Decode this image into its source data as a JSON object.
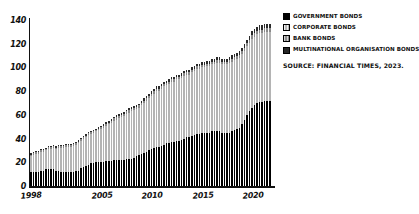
{
  "chart_data": {
    "type": "bar",
    "stacked": true,
    "title": "",
    "subtitle": "",
    "xlabel": "",
    "ylabel": "",
    "ylim": [
      0,
      140
    ],
    "yticks": [
      0,
      20,
      40,
      60,
      80,
      100,
      120,
      140
    ],
    "xticks": [
      "1998",
      "2005",
      "2010",
      "2015",
      "2020"
    ],
    "xtick_indices": [
      0,
      28,
      48,
      68,
      88
    ],
    "grid": false,
    "legend_position": "top-right",
    "x": [
      "1998",
      "1998",
      "1998",
      "1998",
      "1999",
      "1999",
      "1999",
      "1999",
      "2000",
      "2000",
      "2000",
      "2000",
      "2001",
      "2001",
      "2001",
      "2001",
      "2002",
      "2002",
      "2002",
      "2002",
      "2003",
      "2003",
      "2003",
      "2003",
      "2004",
      "2004",
      "2004",
      "2004",
      "2005",
      "2005",
      "2005",
      "2005",
      "2006",
      "2006",
      "2006",
      "2006",
      "2007",
      "2007",
      "2007",
      "2007",
      "2008",
      "2008",
      "2008",
      "2008",
      "2009",
      "2009",
      "2009",
      "2009",
      "2010",
      "2010",
      "2010",
      "2010",
      "2011",
      "2011",
      "2011",
      "2011",
      "2012",
      "2012",
      "2012",
      "2012",
      "2013",
      "2013",
      "2013",
      "2013",
      "2014",
      "2014",
      "2014",
      "2014",
      "2015",
      "2015",
      "2015",
      "2015",
      "2016",
      "2016",
      "2016",
      "2016",
      "2017",
      "2017",
      "2017",
      "2017",
      "2018",
      "2018",
      "2018",
      "2018",
      "2019",
      "2019",
      "2019",
      "2019",
      "2020",
      "2020",
      "2020",
      "2020",
      "2021",
      "2021",
      "2021",
      "2021"
    ],
    "series": [
      {
        "name": "Government bonds",
        "color": "#000000",
        "values": [
          12,
          12,
          12,
          12,
          13,
          13,
          14,
          14,
          14,
          14,
          13,
          13,
          12,
          12,
          12,
          12,
          12,
          12,
          13,
          13,
          15,
          16,
          17,
          18,
          19,
          19,
          20,
          20,
          20,
          20,
          21,
          21,
          21,
          22,
          22,
          22,
          22,
          22,
          23,
          23,
          23,
          24,
          25,
          26,
          27,
          28,
          29,
          30,
          31,
          32,
          33,
          33,
          34,
          35,
          36,
          36,
          37,
          37,
          38,
          38,
          39,
          40,
          41,
          41,
          42,
          43,
          44,
          44,
          45,
          45,
          45,
          45,
          46,
          46,
          46,
          46,
          45,
          45,
          45,
          45,
          46,
          47,
          48,
          49,
          52,
          56,
          60,
          63,
          66,
          68,
          70,
          71,
          71,
          72,
          72,
          72
        ]
      },
      {
        "name": "Corporate bonds",
        "color": "#b4b4b4",
        "values": [
          13,
          14,
          15,
          15,
          16,
          16,
          16,
          17,
          17,
          18,
          18,
          19,
          20,
          20,
          21,
          21,
          21,
          22,
          22,
          23,
          23,
          24,
          24,
          25,
          25,
          26,
          26,
          27,
          28,
          29,
          30,
          31,
          32,
          33,
          34,
          35,
          36,
          37,
          38,
          39,
          40,
          40,
          40,
          40,
          41,
          42,
          43,
          44,
          45,
          46,
          47,
          47,
          48,
          49,
          49,
          50,
          51,
          51,
          52,
          52,
          52,
          53,
          53,
          53,
          54,
          54,
          55,
          55,
          55,
          55,
          56,
          56,
          57,
          57,
          58,
          58,
          58,
          58,
          58,
          59,
          59,
          59,
          59,
          59,
          59,
          58,
          58,
          58,
          58,
          58,
          58,
          58,
          58,
          58,
          58,
          58
        ]
      },
      {
        "name": "Bank bonds",
        "color": "#8a8a8a",
        "values": [
          1.5,
          1.5,
          1.5,
          1.5,
          1.5,
          1.5,
          1.5,
          1.5,
          1.5,
          1.5,
          1.5,
          1.5,
          1.5,
          1.5,
          1.5,
          1.5,
          1.5,
          1.5,
          1.5,
          1.5,
          1.5,
          1.5,
          1.5,
          1.5,
          1.5,
          1.5,
          1.5,
          1.5,
          1.5,
          1.5,
          1.5,
          1.5,
          2,
          2,
          2,
          2,
          2,
          2,
          2,
          2,
          2,
          2,
          2,
          2,
          2,
          2,
          2,
          2,
          2,
          2,
          2,
          2,
          2,
          2,
          2,
          2,
          2,
          2,
          2,
          2,
          2,
          2,
          2,
          2,
          2,
          2,
          2,
          2,
          2,
          2,
          2,
          2,
          2,
          2,
          2,
          2,
          2,
          2,
          2,
          2,
          2.5,
          2.5,
          2.5,
          2.5,
          2.5,
          2.5,
          2.5,
          2.5,
          3,
          3,
          3,
          3,
          3,
          3,
          3,
          3
        ]
      },
      {
        "name": "Multinational organisation bonds",
        "color": "#2a2a2a",
        "values": [
          1,
          1,
          1,
          1,
          1,
          1,
          1,
          1,
          1,
          1,
          1,
          1,
          1,
          1,
          1,
          1,
          1,
          1,
          1,
          1,
          1,
          1,
          1,
          1,
          1,
          1,
          1,
          1,
          1.5,
          1.5,
          1.5,
          1.5,
          1.5,
          1.5,
          1.5,
          1.5,
          1.5,
          1.5,
          1.5,
          1.5,
          1.5,
          1.5,
          1.5,
          1.5,
          2,
          2,
          2,
          2,
          2,
          2,
          2,
          2,
          2,
          2,
          2,
          2,
          2,
          2,
          2,
          2,
          2,
          2,
          2,
          2,
          2,
          2,
          2,
          2,
          2.5,
          2.5,
          2.5,
          2.5,
          2.5,
          2.5,
          2.5,
          2.5,
          2.5,
          2.5,
          2.5,
          2.5,
          3,
          3,
          3,
          3,
          3,
          3,
          3,
          3,
          3.5,
          3.5,
          3.5,
          3.5,
          4,
          4,
          4,
          4
        ]
      }
    ]
  },
  "legend": {
    "items": [
      {
        "label": "GOVERNMENT BONDS",
        "swatch": "swatch-government"
      },
      {
        "label": "CORPORATE BONDS",
        "swatch": "swatch-corporate"
      },
      {
        "label": "BANK BONDS",
        "swatch": "swatch-bank"
      },
      {
        "label": "MULTINATIONAL ORGANISATION BONDS",
        "swatch": "swatch-multinational"
      }
    ]
  },
  "source": {
    "text": "SOURCE: FINANCIAL TIMES, 2023."
  }
}
